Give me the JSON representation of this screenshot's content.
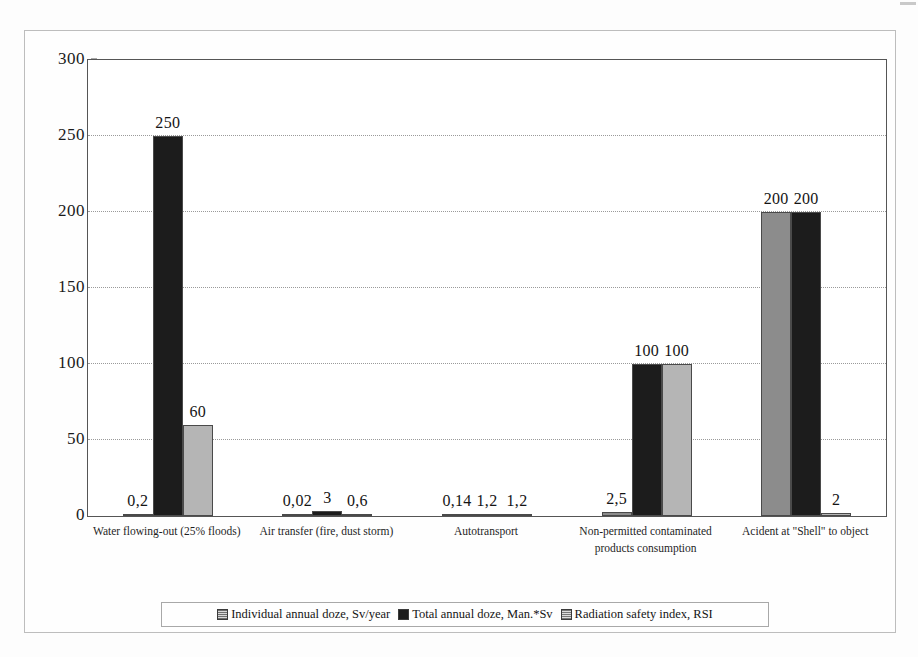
{
  "chart_data": {
    "type": "bar",
    "title": "",
    "xlabel": "",
    "ylabel": "",
    "ylim": [
      0,
      300
    ],
    "yticks": [
      0,
      50,
      100,
      150,
      200,
      250,
      300
    ],
    "grid": true,
    "legend_position": "bottom",
    "data_label_format": "comma-decimal",
    "categories": [
      "Water flowing-out (25% floods)",
      "Air transfer (fire, dust storm)",
      "Autotransport",
      "Non-permitted contaminated products consumption",
      "Acident at \"Shell\" to object"
    ],
    "series": [
      {
        "name": "Individual annual doze, Sv/year",
        "color": "#8c8c8c",
        "values": [
          0.2,
          0.02,
          0.14,
          2.5,
          200
        ],
        "labels": [
          "0,2",
          "0,02",
          "0,14",
          "2,5",
          "200"
        ]
      },
      {
        "name": "Total annual doze, Man.*Sv",
        "color": "#1c1c1c",
        "values": [
          250,
          3,
          1.2,
          100,
          200
        ],
        "labels": [
          "250",
          "3",
          "1,2",
          "100",
          "200"
        ]
      },
      {
        "name": "Radiation safety index, RSI",
        "color": "#b5b5b5",
        "values": [
          60,
          0.6,
          1.2,
          100,
          2
        ],
        "labels": [
          "60",
          "0,6",
          "1,2",
          "100",
          "2"
        ]
      }
    ]
  },
  "legend": {
    "items": [
      {
        "label": "Individual annual doze, Sv/year",
        "swatch": "pattern-grid-gray"
      },
      {
        "label": "Total annual doze, Man.*Sv",
        "swatch": "solid-black"
      },
      {
        "label": "Radiation safety index, RSI",
        "swatch": "pattern-grid-light"
      }
    ]
  },
  "y_axis": {
    "tick_labels": [
      "300",
      "250",
      "200",
      "150",
      "100",
      "50",
      "0"
    ]
  },
  "x_axis": {
    "tick_labels": [
      "Water flowing-out (25% floods)",
      "Air transfer (fire, dust storm)",
      "Autotransport",
      "Non-permitted contaminated products consumption",
      "Acident at \"Shell\" to object"
    ]
  }
}
